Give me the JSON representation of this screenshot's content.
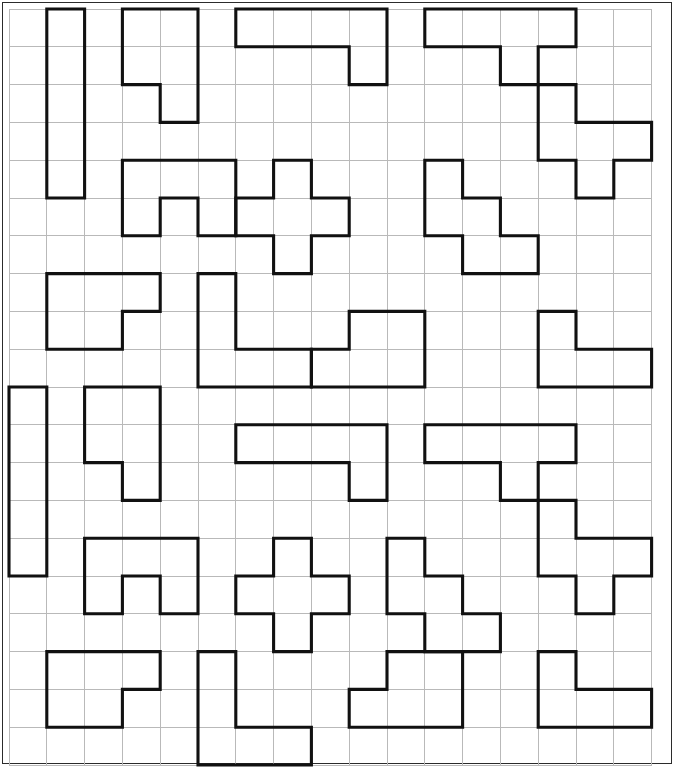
{
  "page": {
    "background_color": "#ffffff",
    "border_color": "#2b2b2b",
    "grid_line_color": "#b9b9b9",
    "shape_stroke_color": "#111111"
  },
  "grid": {
    "origin_x": 9,
    "origin_y": 9,
    "cell_size": 37.8,
    "columns": 17,
    "rows": 20
  },
  "chart_data": {
    "type": "table",
    "xlabel": "column",
    "ylabel": "row",
    "grid": true,
    "legend": "none",
    "columns": 17,
    "rows": 20,
    "shape_count": 28,
    "shapes": [
      {
        "name": "I-pentomino-vertical",
        "cells": [
          [
            1,
            0
          ],
          [
            1,
            1
          ],
          [
            1,
            2
          ],
          [
            1,
            3
          ],
          [
            1,
            4
          ]
        ]
      },
      {
        "name": "N-pentomino",
        "cells": [
          [
            3,
            0
          ],
          [
            4,
            0
          ],
          [
            3,
            1
          ],
          [
            4,
            1
          ],
          [
            4,
            2
          ]
        ]
      },
      {
        "name": "L-pentomino",
        "cells": [
          [
            6,
            0
          ],
          [
            7,
            0
          ],
          [
            8,
            0
          ],
          [
            9,
            0
          ],
          [
            9,
            1
          ]
        ]
      },
      {
        "name": "T-pentomino",
        "cells": [
          [
            11,
            0
          ],
          [
            12,
            0
          ],
          [
            13,
            0
          ],
          [
            14,
            0
          ],
          [
            13,
            1
          ]
        ]
      },
      {
        "name": "W-pentomino-right",
        "cells": [
          [
            14,
            2
          ],
          [
            14,
            3
          ],
          [
            15,
            3
          ],
          [
            16,
            3
          ],
          [
            15,
            4
          ]
        ]
      },
      {
        "name": "U-pentomino",
        "cells": [
          [
            3,
            4
          ],
          [
            4,
            4
          ],
          [
            5,
            4
          ],
          [
            3,
            5
          ],
          [
            5,
            5
          ]
        ]
      },
      {
        "name": "X-pentomino-cross",
        "cells": [
          [
            7,
            4
          ],
          [
            6,
            5
          ],
          [
            7,
            5
          ],
          [
            8,
            5
          ],
          [
            7,
            6
          ]
        ]
      },
      {
        "name": "W-pentomino-mid",
        "cells": [
          [
            11,
            4
          ],
          [
            11,
            5
          ],
          [
            12,
            5
          ],
          [
            12,
            6
          ],
          [
            13,
            6
          ]
        ]
      },
      {
        "name": "P-pentomino",
        "cells": [
          [
            1,
            7
          ],
          [
            2,
            7
          ],
          [
            3,
            7
          ],
          [
            1,
            8
          ],
          [
            2,
            8
          ]
        ]
      },
      {
        "name": "L-pentomino-tall",
        "cells": [
          [
            5,
            7
          ],
          [
            5,
            8
          ],
          [
            5,
            9
          ],
          [
            6,
            9
          ],
          [
            7,
            9
          ]
        ]
      },
      {
        "name": "S-pentomino",
        "cells": [
          [
            9,
            8
          ],
          [
            10,
            8
          ],
          [
            8,
            9
          ],
          [
            9,
            9
          ],
          [
            10,
            9
          ]
        ]
      },
      {
        "name": "V-pentomino-right",
        "cells": [
          [
            14,
            8
          ],
          [
            14,
            9
          ],
          [
            15,
            9
          ],
          [
            16,
            9
          ]
        ]
      },
      {
        "name": "I-pentomino-left-edge",
        "cells": [
          [
            0,
            10
          ],
          [
            0,
            11
          ],
          [
            0,
            12
          ],
          [
            0,
            13
          ],
          [
            0,
            14
          ]
        ]
      },
      {
        "name": "N-pentomino-left",
        "cells": [
          [
            2,
            10
          ],
          [
            3,
            10
          ],
          [
            2,
            11
          ],
          [
            3,
            11
          ],
          [
            3,
            12
          ]
        ]
      },
      {
        "name": "L-pentomino-mid",
        "cells": [
          [
            6,
            11
          ],
          [
            7,
            11
          ],
          [
            8,
            11
          ],
          [
            9,
            11
          ],
          [
            9,
            12
          ]
        ]
      },
      {
        "name": "T-pentomino-mid",
        "cells": [
          [
            11,
            11
          ],
          [
            12,
            11
          ],
          [
            13,
            11
          ],
          [
            14,
            11
          ],
          [
            13,
            12
          ]
        ]
      },
      {
        "name": "W-pentomino-lower-right",
        "cells": [
          [
            14,
            13
          ],
          [
            14,
            14
          ],
          [
            15,
            14
          ],
          [
            16,
            14
          ],
          [
            15,
            15
          ]
        ]
      },
      {
        "name": "U-pentomino-lower",
        "cells": [
          [
            2,
            14
          ],
          [
            3,
            14
          ],
          [
            4,
            14
          ],
          [
            2,
            15
          ],
          [
            4,
            15
          ]
        ]
      },
      {
        "name": "X-pentomino-cross-lower",
        "cells": [
          [
            7,
            14
          ],
          [
            6,
            15
          ],
          [
            7,
            15
          ],
          [
            8,
            15
          ],
          [
            7,
            16
          ]
        ]
      },
      {
        "name": "W-pentomino-lower-mid",
        "cells": [
          [
            10,
            14
          ],
          [
            10,
            15
          ],
          [
            11,
            15
          ],
          [
            11,
            16
          ],
          [
            12,
            16
          ]
        ]
      },
      {
        "name": "L-pentomino-bottom",
        "cells": [
          [
            5,
            17
          ],
          [
            5,
            18
          ],
          [
            5,
            19
          ],
          [
            6,
            19
          ],
          [
            7,
            19
          ]
        ]
      },
      {
        "name": "P-pentomino-bottom",
        "cells": [
          [
            1,
            17
          ],
          [
            2,
            17
          ],
          [
            3,
            17
          ],
          [
            1,
            18
          ],
          [
            2,
            18
          ]
        ]
      },
      {
        "name": "S-pentomino-bottom",
        "cells": [
          [
            10,
            17
          ],
          [
            11,
            17
          ],
          [
            9,
            18
          ],
          [
            10,
            18
          ],
          [
            11,
            18
          ]
        ]
      },
      {
        "name": "V-pentomino-bottom-right",
        "cells": [
          [
            14,
            17
          ],
          [
            14,
            18
          ],
          [
            15,
            18
          ],
          [
            16,
            18
          ]
        ]
      }
    ]
  },
  "outlines": {
    "description": "Heavy black outlines of pentomino pieces drawn on a light grey grid.",
    "paths": [
      "M1,0 H2 V5 H1 Z",
      "M3,0 H5 V3 H4 V2 H3 Z",
      "M6,0 H10 V2 H9 V1 H6 Z",
      "M11,0 H15 V2 H14 V1 H13 V2 H12 V1 H11 Z",
      "M14,2 H15 V3 H17 V5 H16 V4 H15 V4 H14 Z",
      "M3,4 H6 V6 H5 V5 H4 V6 H3 Z",
      "M7,4 H8 V5 H9 V6 H8 V7 H7 V6 H6 V5 H7 Z",
      "M11,4 H13 V6 H14 V8 H13 V7 H12 V6 H11 Z",
      "M1,7 H4 V8 H3 V9 H1 Z",
      "M5,7 H6 V9 H8 V10 H5 Z",
      "M9,8 H11 V10 H8 V9 H9 Z",
      "M14,8 H15 V9 H17 V10 H14 Z",
      "M0,10 H1 V15 H0 Z",
      "M2,10 H4 V13 H3 V12 H2 Z",
      "M6,11 H10 V13 H9 V12 H6 Z",
      "M11,11 H15 V13 H14 V12 H13 V13 H12 V12 H11 Z",
      "M14,13 H15 V14 H17 V16 H16 V15 H14 Z",
      "M2,14 H5 V16 H4 V15 H3 V16 H2 Z",
      "M7,14 H8 V15 H9 V16 H8 V17 H7 V16 H6 V15 H7 Z",
      "M10,14 H11 V16 H12 V18 H11 V17 H10 Z",
      "M5,17 H6 V19 H8 V20 H5 Z",
      "M1,17 H4 V18 H3 V19 H1 Z",
      "M9,17 H12 V19 H9 V18 H9 Z",
      "M14,17 H15 V18 H17 V20 H16 V19 H14 Z"
    ]
  }
}
